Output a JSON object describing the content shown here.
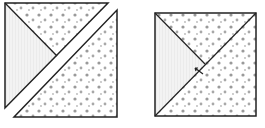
{
  "figure": {
    "colors": {
      "line": "#222222",
      "solid_fabric": "#f1f1f1",
      "print_background": "#ffffff",
      "print_dot": "#9a9a9a"
    },
    "left_block": {
      "label": "separated triangles"
    },
    "right_block": {
      "label": "joined square"
    }
  }
}
